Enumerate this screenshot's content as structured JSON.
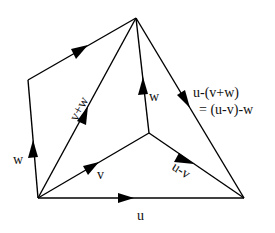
{
  "diagram": {
    "points": {
      "O": [
        38,
        198
      ],
      "U": [
        244,
        198
      ],
      "W": [
        28,
        80
      ],
      "T": [
        136,
        18
      ],
      "V": [
        149,
        133
      ]
    },
    "vectors": [
      {
        "id": "u",
        "from": "O",
        "to": "U",
        "label": "u"
      },
      {
        "id": "v",
        "from": "O",
        "to": "V",
        "label": "v"
      },
      {
        "id": "w_left",
        "from": "O",
        "to": "W",
        "label": "w"
      },
      {
        "id": "v_plus_w",
        "from": "O",
        "to": "T",
        "label": "v+w"
      },
      {
        "id": "v_top",
        "from": "W",
        "to": "T",
        "label": ""
      },
      {
        "id": "w_inner",
        "from": "V",
        "to": "T",
        "label": "w"
      },
      {
        "id": "u_minus_v",
        "from": "V",
        "to": "U",
        "label": "u-v"
      },
      {
        "id": "u_minus_vw",
        "from": "T",
        "to": "U",
        "label": "u-(v+w)"
      }
    ],
    "labels": {
      "u": "u",
      "v": "v",
      "w_left": "w",
      "w_inner": "w",
      "v_plus_w": "v+w",
      "u_minus_v": "u-v",
      "u_minus_vw_line1": "u-(v+w)",
      "u_minus_vw_line2": "= (u-v)-w"
    },
    "colors": {
      "stroke": "#000000",
      "background": "#ffffff"
    }
  }
}
